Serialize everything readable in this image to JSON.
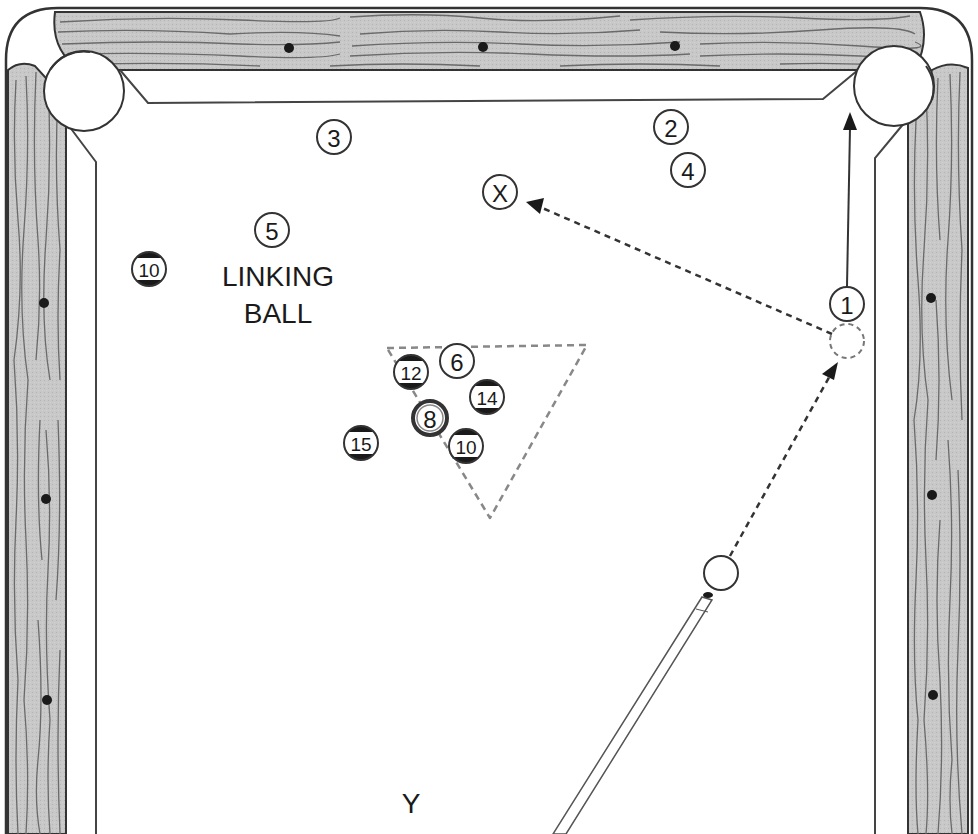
{
  "diagram": {
    "colors": {
      "rail_wood": "#c4c4c4",
      "grain": "#6a6a6a",
      "outline": "#333333",
      "diamond": "#1a1a1a",
      "cloth": "#ffffff",
      "dashed": "#777777"
    },
    "labels": {
      "linking_ball_line1": "LINKING",
      "linking_ball_line2": "BALL",
      "target_x": "X",
      "position_y": "Y"
    },
    "balls": [
      {
        "id": "ball-1",
        "number": "1",
        "x": 847,
        "y": 304,
        "striped": false
      },
      {
        "id": "ball-2",
        "number": "2",
        "x": 671,
        "y": 127,
        "striped": false
      },
      {
        "id": "ball-3",
        "number": "3",
        "x": 334,
        "y": 137,
        "striped": false
      },
      {
        "id": "ball-4",
        "number": "4",
        "x": 688,
        "y": 170,
        "striped": false
      },
      {
        "id": "ball-5",
        "number": "5",
        "x": 272,
        "y": 230,
        "striped": false
      },
      {
        "id": "ball-6",
        "number": "6",
        "x": 457,
        "y": 361,
        "striped": false
      },
      {
        "id": "ball-8",
        "number": "8",
        "x": 430,
        "y": 418,
        "striped": false,
        "eight": true
      },
      {
        "id": "ball-10a",
        "number": "10",
        "x": 149,
        "y": 269,
        "striped": true
      },
      {
        "id": "ball-10b",
        "number": "10",
        "x": 466,
        "y": 446,
        "striped": true
      },
      {
        "id": "ball-12",
        "number": "12",
        "x": 411,
        "y": 372,
        "striped": true
      },
      {
        "id": "ball-14",
        "number": "14",
        "x": 487,
        "y": 397,
        "striped": true
      },
      {
        "id": "ball-15",
        "number": "15",
        "x": 361,
        "y": 443,
        "striped": true
      }
    ],
    "cue_ball": {
      "x": 721,
      "y": 573
    },
    "ghost_ball": {
      "x": 847,
      "y": 341
    },
    "target_x_ball": {
      "x": 500,
      "y": 192
    }
  }
}
